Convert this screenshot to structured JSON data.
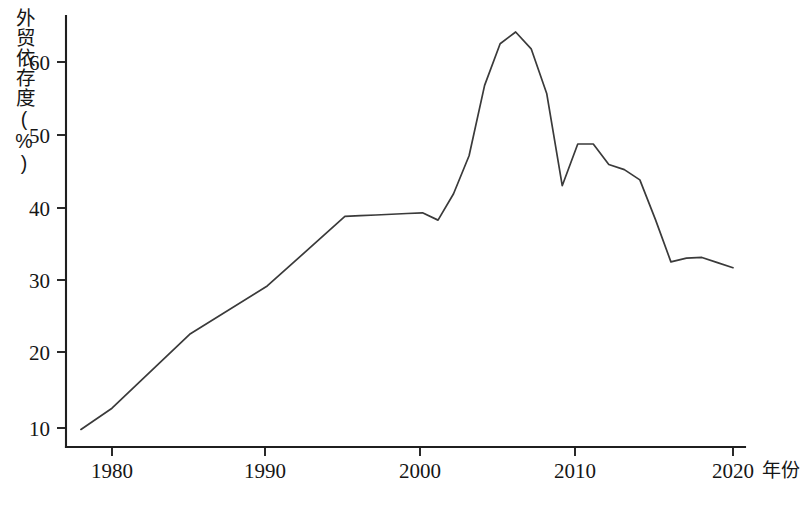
{
  "axes": {
    "y_title": "外贸依存度(%)",
    "x_title": "年份",
    "y_ticks": [
      "10",
      "20",
      "30",
      "40",
      "50",
      "60"
    ],
    "x_ticks": [
      "1980",
      "1990",
      "2000",
      "2010",
      "2020"
    ]
  },
  "chart_data": {
    "type": "line",
    "title": "",
    "subtitle": "",
    "xlabel": "年份",
    "ylabel": "外贸依存度(%)",
    "xlim": [
      1978,
      2020
    ],
    "ylim": [
      8.5,
      66.5
    ],
    "grid": false,
    "legend": "none",
    "xticks": [
      1980,
      1990,
      2000,
      2010,
      2020
    ],
    "yticks": [
      10,
      20,
      30,
      40,
      50,
      60
    ],
    "series": [
      {
        "name": "外贸依存度",
        "x": [
          1978,
          1980,
          1985,
          1990,
          1995,
          1996,
          1997,
          1998,
          1999,
          2000,
          2001,
          2002,
          2003,
          2004,
          2005,
          2006,
          2007,
          2008,
          2009,
          2010,
          2011,
          2012,
          2013,
          2014,
          2015,
          2016,
          2017,
          2018,
          2019,
          2020
        ],
        "values": [
          9.8,
          12.7,
          22.8,
          29.4,
          38.9,
          39.0,
          39.1,
          39.2,
          39.3,
          39.4,
          38.4,
          42.0,
          47.2,
          56.8,
          62.5,
          64.1,
          61.8,
          55.7,
          43.1,
          48.8,
          48.8,
          46.0,
          45.3,
          43.9,
          38.5,
          32.7,
          33.2,
          33.3,
          32.6,
          31.9
        ]
      }
    ]
  },
  "geometry": {
    "plot_left": 66,
    "plot_right": 745,
    "plot_top": 16,
    "plot_bottom": 447,
    "x_year_min": 1978,
    "x_year_max": 2021.8,
    "y_value_at_bottom": 3.0,
    "y_value_at_top": 62.7
  }
}
